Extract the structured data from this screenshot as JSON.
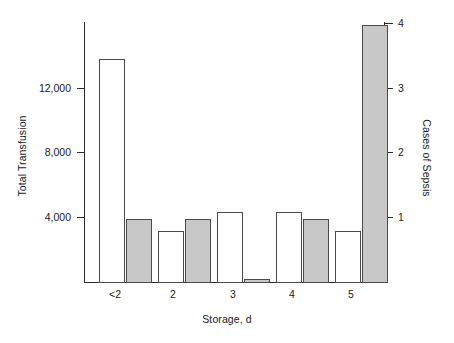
{
  "chart_data": {
    "type": "bar",
    "title": "",
    "xlabel": "Storage, d",
    "categories": [
      "<2",
      "2",
      "3",
      "4",
      "5"
    ],
    "grid": false,
    "legend_position": "none",
    "series": [
      {
        "name": "Total Transfusion",
        "axis": "left",
        "color": "#ffffff",
        "edge_color": "#4a4a4a",
        "values": [
          13900,
          3200,
          4400,
          4400,
          3250
        ]
      },
      {
        "name": "Cases of Sepsis",
        "axis": "right",
        "color": "#c8c8c8",
        "edge_color": "#4a4a4a",
        "values": [
          1,
          1,
          0.05,
          1,
          4
        ]
      }
    ],
    "axes": {
      "left": {
        "label": "Total Transfusion",
        "ticks": [
          4000,
          8000,
          12000
        ],
        "tick_labels": [
          "4,000",
          "8,000",
          "12,000"
        ],
        "range": [
          0,
          16000
        ]
      },
      "right": {
        "label": "Cases of Sepsis",
        "ticks": [
          1,
          2,
          3,
          4
        ],
        "tick_labels": [
          "1",
          "2",
          "3",
          "4"
        ],
        "range": [
          0,
          4.05
        ]
      },
      "x": {
        "label": "Storage, d",
        "tick_labels": [
          "<2",
          "2",
          "3",
          "4",
          "5"
        ]
      }
    }
  },
  "caption": ""
}
